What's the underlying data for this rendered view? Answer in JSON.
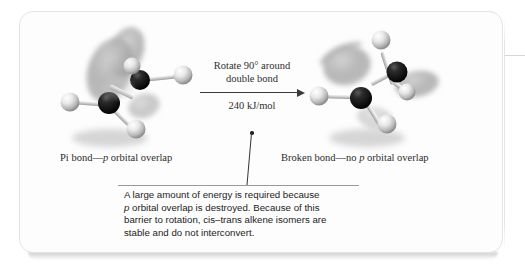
{
  "figure": {
    "type": "chemistry-illustration"
  },
  "reaction": {
    "arrow_label_line1": "Rotate 90° around",
    "arrow_label_line2": "double bond",
    "energy": "240 kJ/mol"
  },
  "captions": {
    "left_before": "Pi bond—",
    "left_italic": "p",
    "left_after": " orbital overlap",
    "right_before": "Broken bond—no ",
    "right_italic": "p",
    "right_after": " orbital overlap"
  },
  "note": {
    "line1": "A large amount of energy is required because",
    "line2_italic": "p",
    "line2_after": " orbital overlap is destroyed. Because of this",
    "line3": "barrier to rotation, cis–trans alkene isomers are",
    "line4": "stable and do not interconvert."
  },
  "molecules": {
    "left": {
      "label": "pi-bonded-alkene-model",
      "atoms": [
        "carbon",
        "carbon",
        "hydrogen",
        "hydrogen",
        "hydrogen",
        "hydrogen"
      ],
      "orbitals": "aligned p orbitals overlapping"
    },
    "right": {
      "label": "rotated-alkene-model",
      "atoms": [
        "carbon",
        "carbon",
        "hydrogen",
        "hydrogen",
        "hydrogen",
        "hydrogen"
      ],
      "orbitals": "perpendicular p orbitals, no overlap"
    }
  },
  "colors": {
    "card_background": "#fdfdfd",
    "card_border": "#e3e3e3",
    "text": "#2b2b2b",
    "note_text": "#222222",
    "rule": "#9a9a9a",
    "carbon": "#151515",
    "hydrogen": "#f2f2f2",
    "orbital": "#9a9a9a"
  }
}
